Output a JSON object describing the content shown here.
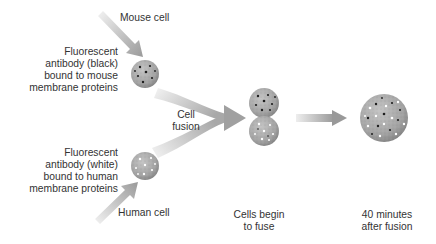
{
  "diagram": {
    "colors": {
      "arrow_light": "#e6e6e6",
      "arrow_dark": "#9a9a9a",
      "cell_fill": "#a9a9a9",
      "cell_edge": "#7f7f7f",
      "text": "#333333",
      "background": "#ffffff"
    },
    "labels": {
      "mouse_cell": "Mouse cell",
      "human_cell": "Human cell",
      "mouse_antibody": [
        "Fluorescent",
        "antibody (black)",
        "bound to mouse",
        "membrane proteins"
      ],
      "human_antibody": [
        "Fluorescent",
        "antibody (white)",
        "bound to human",
        "membrane proteins"
      ],
      "cell_fusion": [
        "Cell",
        "fusion"
      ],
      "cells_begin": [
        "Cells begin",
        "to fuse"
      ],
      "after_fusion": [
        "40 minutes",
        "after fusion"
      ]
    },
    "nodes": [
      {
        "id": "mouse-cell",
        "cx": 145,
        "cy": 74,
        "r": 14,
        "markers": "black"
      },
      {
        "id": "human-cell",
        "cx": 145,
        "cy": 166,
        "r": 14,
        "markers": "white"
      },
      {
        "id": "fusing-mouse-cell",
        "cx": 264,
        "cy": 103,
        "r": 15,
        "markers": "black"
      },
      {
        "id": "fusing-human-cell",
        "cx": 264,
        "cy": 131,
        "r": 15,
        "markers": "white"
      },
      {
        "id": "hybrid-cell",
        "cx": 384,
        "cy": 118,
        "r": 24,
        "markers": "mixed"
      }
    ],
    "edges": [
      {
        "from": "mouse-label",
        "to": "mouse-cell",
        "type": "straight-arrow"
      },
      {
        "from": "human-label",
        "to": "human-cell",
        "type": "straight-arrow"
      },
      {
        "from": [
          "mouse-cell",
          "human-cell"
        ],
        "to": "fusing-cells",
        "type": "merging-arrow",
        "label": "Cell fusion"
      },
      {
        "from": "fusing-cells",
        "to": "hybrid-cell",
        "type": "straight-arrow"
      }
    ]
  }
}
